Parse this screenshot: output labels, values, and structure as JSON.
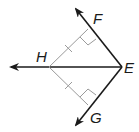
{
  "diagram": {
    "type": "geometry",
    "colors": {
      "ray": "#1a1a1a",
      "segment": "#9a9a9a"
    },
    "points": {
      "E": {
        "label": "E",
        "x": 122,
        "y": 67
      },
      "H": {
        "label": "H",
        "x": 49,
        "y": 67
      },
      "F": {
        "label": "F",
        "x": 96,
        "y": 21
      },
      "G": {
        "label": "G",
        "x": 94,
        "y": 118
      }
    },
    "rays": [
      "EF",
      "EG",
      "EH"
    ],
    "perpendiculars": [
      {
        "from": "H",
        "to_ray": "EF",
        "right_angle": true,
        "tick_marks": 1
      },
      {
        "from": "H",
        "to_ray": "EG",
        "right_angle": true,
        "tick_marks": 1
      }
    ]
  }
}
